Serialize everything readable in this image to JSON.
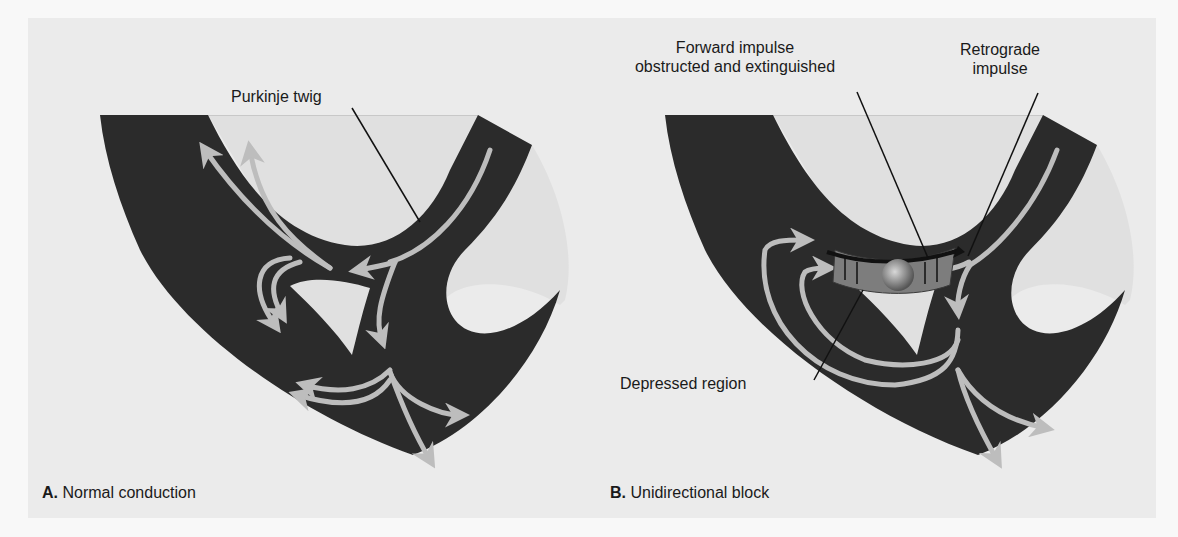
{
  "panels": [
    {
      "id": "A",
      "caption_letter": "A.",
      "caption_text": "Normal conduction",
      "annotations": [
        {
          "text": "Purkinje twig"
        }
      ]
    },
    {
      "id": "B",
      "caption_letter": "B.",
      "caption_text": "Unidirectional block",
      "annotations": [
        {
          "line1": "Forward impulse",
          "line2": "obstructed and extinguished"
        },
        {
          "line1": "Retrograde",
          "line2": "impulse"
        },
        {
          "text": "Depressed region"
        }
      ]
    }
  ],
  "colors": {
    "tissue": "#2b2b2b",
    "cavity": "#e0e0e0",
    "impulse_arrow": "#bdbdbd",
    "background": "#ebebeb"
  }
}
